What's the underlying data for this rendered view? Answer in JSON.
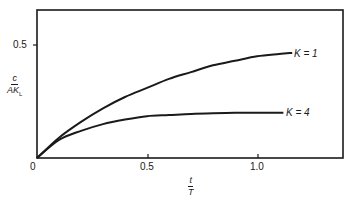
{
  "chart": {
    "y_tick_label": "0.5",
    "origin_label": "0",
    "x_tick_labels": [
      "0.5",
      "1.0"
    ],
    "y_axis_label": {
      "numerator": "c",
      "denominator": "AK",
      "denominator_subscript": "L"
    },
    "x_axis_label": {
      "numerator": "t",
      "denominator": "T"
    },
    "series_labels": [
      "K = 1",
      "K = 4"
    ]
  },
  "chart_data": {
    "type": "line",
    "title": "",
    "xlabel": "t/T",
    "ylabel": "c/(A K_L)",
    "xlim": [
      0,
      1.39
    ],
    "ylim": [
      0,
      0.66
    ],
    "x_ticks": [
      0,
      0.5,
      1.0
    ],
    "y_ticks": [
      0.5
    ],
    "grid": false,
    "legend_position": "inline-right",
    "series": [
      {
        "name": "K = 1",
        "x": [
          0,
          0.1,
          0.2,
          0.3,
          0.4,
          0.5,
          0.6,
          0.7,
          0.8,
          0.9,
          1.0,
          1.1,
          1.16
        ],
        "values": [
          0,
          0.09,
          0.16,
          0.22,
          0.27,
          0.31,
          0.35,
          0.38,
          0.41,
          0.43,
          0.45,
          0.46,
          0.465
        ]
      },
      {
        "name": "K = 4",
        "x": [
          0,
          0.1,
          0.2,
          0.3,
          0.4,
          0.5,
          0.6,
          0.7,
          0.8,
          0.9,
          1.0,
          1.12
        ],
        "values": [
          0,
          0.08,
          0.12,
          0.15,
          0.17,
          0.185,
          0.19,
          0.195,
          0.198,
          0.2,
          0.2,
          0.2
        ]
      }
    ]
  }
}
